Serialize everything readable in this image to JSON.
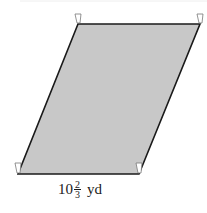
{
  "figure": {
    "shape": "parallelogram",
    "fill_color": "#c8c8c8",
    "stroke_color": "#1a1a1a",
    "vertices": {
      "top_left": [
        78,
        24
      ],
      "top_right": [
        200,
        24
      ],
      "bottom_right": [
        139,
        174
      ],
      "bottom_left": [
        18,
        174
      ]
    },
    "label": {
      "whole": "10",
      "numerator": "2",
      "denominator": "3",
      "unit": "yd",
      "text": "10 2/3 yd"
    }
  }
}
